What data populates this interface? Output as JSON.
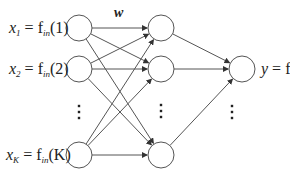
{
  "diagram": {
    "type": "feedforward-neural-network",
    "weight_label": "w",
    "colors": {
      "stroke": "#555555",
      "text": "#222222",
      "background": "#ffffff"
    },
    "node_radius": 13,
    "layers": [
      {
        "name": "input",
        "x": 79,
        "nodes": [
          {
            "id": "x1",
            "y": 28,
            "var": "x",
            "sub": "1",
            "fn": "f",
            "fn_sub": "in",
            "arg": "(1)"
          },
          {
            "id": "x2",
            "y": 69,
            "var": "x",
            "sub": "2",
            "fn": "f",
            "fn_sub": "in",
            "arg": "(2)"
          },
          {
            "id": "xK",
            "y": 155,
            "var": "x",
            "sub": "K",
            "fn": "f",
            "fn_sub": "in",
            "arg": "(K)"
          }
        ],
        "ellipsis_y": 112
      },
      {
        "name": "hidden",
        "x": 161,
        "nodes": [
          {
            "id": "h1",
            "y": 28
          },
          {
            "id": "h2",
            "y": 69
          },
          {
            "id": "hM",
            "y": 155
          }
        ],
        "ellipsis_y": 111
      },
      {
        "name": "output",
        "x": 242,
        "nodes": [
          {
            "id": "y",
            "y": 69,
            "var": "y",
            "fn": "f",
            "fn_sub": "out"
          }
        ],
        "ellipsis_x": 232,
        "ellipsis_y": 112
      }
    ],
    "output_label": {
      "var": "y",
      "eq": " = ",
      "fn": "f",
      "fn_sub": "out"
    }
  }
}
